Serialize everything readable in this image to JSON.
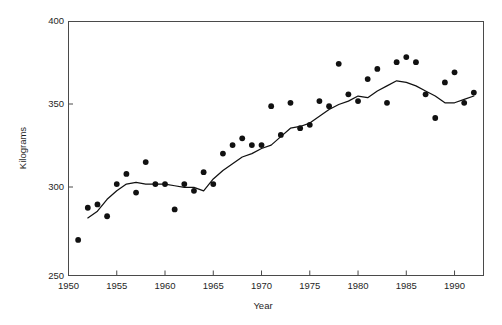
{
  "chart_data": {
    "type": "scatter",
    "title": "",
    "subtitle": "",
    "xlabel": "Year",
    "ylabel": "Kilograms",
    "xlim": [
      1950,
      1993
    ],
    "ylim": [
      250,
      400
    ],
    "grid": false,
    "legend": null,
    "x_ticks": [
      1950,
      1955,
      1960,
      1965,
      1970,
      1975,
      1980,
      1985,
      1990
    ],
    "x_tick_labels": [
      "1950",
      "1955",
      "1960",
      "1965",
      "1970",
      "1975",
      "1980",
      "1985",
      "1990"
    ],
    "y_ticks": [
      250,
      300,
      350,
      400
    ],
    "y_tick_labels": [
      "250",
      "300",
      "350",
      "400"
    ],
    "marker": "filled-circle",
    "marker_color": "#111111",
    "line_color": "#111111",
    "frame_color": "#4a4a4a",
    "x": [
      1951,
      1952,
      1953,
      1954,
      1955,
      1956,
      1957,
      1958,
      1959,
      1960,
      1961,
      1962,
      1963,
      1964,
      1965,
      1966,
      1967,
      1968,
      1969,
      1970,
      1971,
      1972,
      1973,
      1974,
      1975,
      1976,
      1977,
      1978,
      1979,
      1980,
      1981,
      1982,
      1983,
      1984,
      1985,
      1986,
      1987,
      1988,
      1989,
      1990,
      1991,
      1992
    ],
    "series": [
      {
        "name": "Observed",
        "kind": "scatter",
        "values": [
          271,
          290,
          292,
          285,
          304,
          310,
          299,
          317,
          304,
          304,
          289,
          304,
          300,
          311,
          304,
          322,
          327,
          331,
          327,
          327,
          350,
          333,
          352,
          337,
          339,
          353,
          350,
          375,
          357,
          353,
          366,
          372,
          352,
          376,
          379,
          376,
          357,
          343,
          364,
          370,
          352,
          358
        ]
      },
      {
        "name": "Smoothed trend",
        "kind": "line",
        "x": [
          1952,
          1953,
          1954,
          1955,
          1956,
          1957,
          1958,
          1959,
          1960,
          1961,
          1962,
          1963,
          1964,
          1965,
          1966,
          1967,
          1968,
          1969,
          1970,
          1971,
          1972,
          1973,
          1974,
          1975,
          1976,
          1977,
          1978,
          1979,
          1980,
          1981,
          1982,
          1983,
          1984,
          1985,
          1986,
          1987,
          1988,
          1989,
          1990,
          1991,
          1992
        ],
        "values": [
          284,
          288,
          295,
          300,
          304,
          305,
          304,
          304,
          304,
          303,
          302,
          302,
          300,
          307,
          312,
          316,
          320,
          322,
          325,
          327,
          332,
          337,
          338,
          340,
          344,
          348,
          351,
          353,
          356,
          355,
          359,
          362,
          365,
          364,
          362,
          359,
          356,
          352,
          352,
          354,
          356
        ]
      }
    ]
  },
  "axes": {
    "ylabel": "Kilograms",
    "xlabel": "Year"
  }
}
